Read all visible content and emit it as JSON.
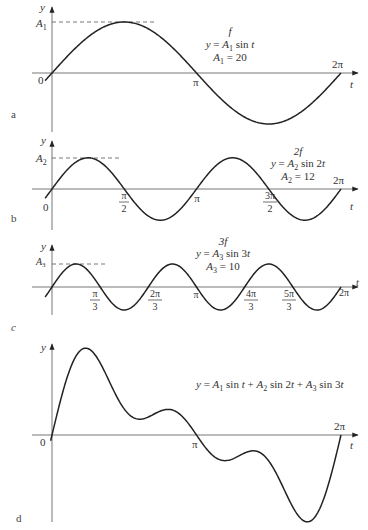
{
  "figure": {
    "panels": [
      {
        "id": "a",
        "letter": "a",
        "harmonic_label": "f",
        "equation": "y = A 1 sin t",
        "amp_text": "A 1 = 20",
        "amp_axis_label": "A 1",
        "tick_labels": [
          {
            "t": "pi",
            "label": "π"
          },
          {
            "t": "2pi",
            "label": "2π"
          }
        ]
      },
      {
        "id": "b",
        "letter": "b",
        "harmonic_label": "2f",
        "equation": "y = A 2 sin 2t",
        "amp_text": "A 2 = 12",
        "amp_axis_label": "A 2",
        "tick_labels": [
          {
            "t": "pi/2",
            "label": "π/2"
          },
          {
            "t": "pi",
            "label": "π"
          },
          {
            "t": "3pi/2",
            "label": "3π/2"
          },
          {
            "t": "2pi",
            "label": "2π"
          }
        ]
      },
      {
        "id": "c",
        "letter": "c",
        "harmonic_label": "3f",
        "equation": "y = A 3 sin 3t",
        "amp_text": "A 3 = 10",
        "amp_axis_label": "A 3",
        "tick_labels": [
          {
            "t": "pi/3",
            "label": "π/3"
          },
          {
            "t": "2pi/3",
            "label": "2π/3"
          },
          {
            "t": "pi",
            "label": "π"
          },
          {
            "t": "4pi/3",
            "label": "4π/3"
          },
          {
            "t": "5pi/3",
            "label": "5π/3"
          },
          {
            "t": "2pi",
            "label": "2π"
          }
        ]
      },
      {
        "id": "d",
        "letter": "d",
        "equation": "y = A 1 sin t + A 2 sin 2t + A 3 sin 3t",
        "tick_labels": [
          {
            "t": "pi",
            "label": "π"
          },
          {
            "t": "2pi",
            "label": "2π"
          }
        ]
      }
    ],
    "axis_labels": {
      "y": "y",
      "x": "t",
      "origin": "0"
    }
  },
  "chart_data": [
    {
      "type": "line",
      "panel": "a",
      "title": "f",
      "function": "y = A1 sin t",
      "amplitude": 20,
      "frequency_multiple": 1,
      "x_range": [
        0,
        6.2832
      ],
      "xlabel": "t",
      "ylabel": "y",
      "x_ticks": [
        "0",
        "π",
        "2π"
      ],
      "y_ticks": [
        "A1"
      ],
      "grid": false
    },
    {
      "type": "line",
      "panel": "b",
      "title": "2f",
      "function": "y = A2 sin 2t",
      "amplitude": 12,
      "frequency_multiple": 2,
      "x_range": [
        0,
        6.2832
      ],
      "xlabel": "t",
      "ylabel": "y",
      "x_ticks": [
        "0",
        "π/2",
        "π",
        "3π/2",
        "2π"
      ],
      "y_ticks": [
        "A2"
      ],
      "grid": false
    },
    {
      "type": "line",
      "panel": "c",
      "title": "3f",
      "function": "y = A3 sin 3t",
      "amplitude": 10,
      "frequency_multiple": 3,
      "x_range": [
        0,
        6.2832
      ],
      "xlabel": "t",
      "ylabel": "y",
      "x_ticks": [
        "π/3",
        "2π/3",
        "π",
        "4π/3",
        "5π/3",
        "2π"
      ],
      "y_ticks": [
        "A3"
      ],
      "grid": false
    },
    {
      "type": "line",
      "panel": "d",
      "title": "",
      "function": "y = A1 sin t + A2 sin 2t + A3 sin 3t",
      "components": [
        {
          "amplitude": 20,
          "frequency_multiple": 1
        },
        {
          "amplitude": 12,
          "frequency_multiple": 2
        },
        {
          "amplitude": 10,
          "frequency_multiple": 3
        }
      ],
      "x_range": [
        0,
        6.2832
      ],
      "xlabel": "t",
      "ylabel": "y",
      "x_ticks": [
        "0",
        "π",
        "2π"
      ],
      "grid": false
    }
  ]
}
